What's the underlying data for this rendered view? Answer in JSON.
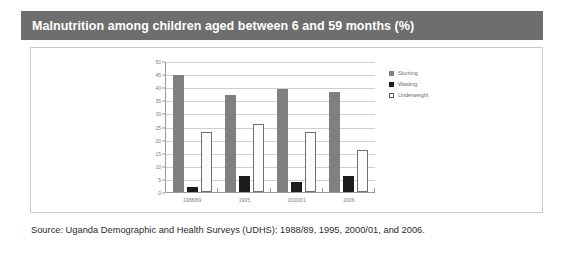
{
  "header": {
    "title": "Malnutrition among children aged between 6 and 59 months (%)",
    "bar_color": "#6e6e6e",
    "text_color": "#ffffff"
  },
  "source": {
    "text": "Source: Uganda Demographic and Health Surveys (UDHS): 1988/89, 1995, 2000/01, and 2006."
  },
  "legend": {
    "position": "right",
    "items": [
      {
        "label": "Stunting",
        "color": "#808080"
      },
      {
        "label": "Wasting",
        "color": "#1c1c1c"
      },
      {
        "label": "Underweight",
        "color": "#ffffff"
      }
    ]
  },
  "chart_data": {
    "type": "bar",
    "title": "Malnutrition among children aged between 6 and 59 months (%)",
    "xlabel": "",
    "ylabel": "",
    "categories": [
      "1988/89",
      "1995",
      "2000/01",
      "2006"
    ],
    "series": [
      {
        "name": "Stunting",
        "color": "#808080",
        "values": [
          45,
          37.5,
          39.5,
          38.5
        ]
      },
      {
        "name": "Wasting",
        "color": "#1c1c1c",
        "values": [
          2,
          6,
          4,
          6
        ]
      },
      {
        "name": "Underweight",
        "color": "#ffffff",
        "values": [
          23,
          26,
          23,
          16
        ]
      }
    ],
    "ylim": [
      0,
      50
    ],
    "ytick_step": 5,
    "yticks": [
      50,
      45,
      40,
      35,
      30,
      25,
      20,
      15,
      10,
      5,
      0
    ],
    "grid": true,
    "legend_position": "right"
  }
}
